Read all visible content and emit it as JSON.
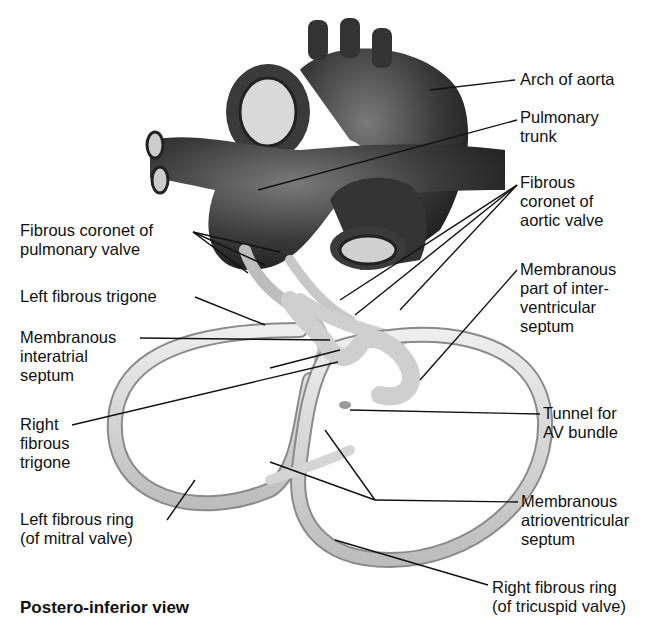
{
  "diagram": {
    "view_title": "Postero-inferior view",
    "labels": {
      "arch_of_aorta": "Arch of aorta",
      "pulmonary_trunk": "Pulmonary\ntrunk",
      "fibrous_coronet_aortic": "Fibrous\ncoronet of\naortic valve",
      "fibrous_coronet_pulmonary": "Fibrous coronet of\npulmonary valve",
      "left_fibrous_trigone": "Left fibrous trigone",
      "membranous_interatrial": "Membranous\ninteratrial\nseptum",
      "membranous_interventricular": "Membranous\npart of inter-\nventricular\nseptum",
      "right_fibrous_trigone": "Right\nfibrous\ntrigone",
      "tunnel_av_bundle": "Tunnel for\nAV bundle",
      "left_fibrous_ring": "Left fibrous ring\n(of mitral valve)",
      "membranous_av_septum": "Membranous\natrioventricular\nseptum",
      "right_fibrous_ring": "Right fibrous ring\n(of tricuspid valve)"
    },
    "colors": {
      "vessel_dark": "#2e2e2e",
      "vessel_mid": "#5a5a5a",
      "skeleton_fill": "#d8d8d8",
      "skeleton_edge": "#8a8a8a",
      "leader_line": "#111111"
    }
  }
}
